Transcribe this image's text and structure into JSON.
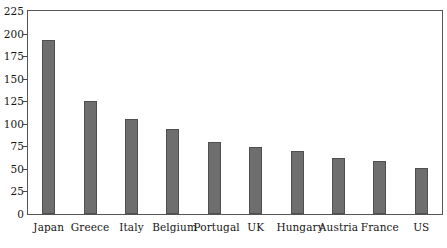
{
  "chart_data": {
    "type": "bar",
    "title": "",
    "subtitle": "",
    "xlabel": "",
    "ylabel": "",
    "categories": [
      "Japan",
      "Greece",
      "Italy",
      "Belgium",
      "Portugal",
      "UK",
      "Hungary",
      "Austria",
      "France",
      "US"
    ],
    "values": [
      193,
      125,
      105,
      94,
      80,
      74,
      70,
      62,
      59,
      51
    ],
    "series": [
      {
        "name": "",
        "values": [
          193,
          125,
          105,
          94,
          80,
          74,
          70,
          62,
          59,
          51
        ]
      }
    ],
    "ylim": [
      0,
      225
    ],
    "xlim": [
      0,
      10
    ],
    "y_ticks": [
      0,
      25,
      50,
      75,
      100,
      125,
      150,
      175,
      200,
      225
    ],
    "y_tick_labels": [
      "0",
      "25",
      "50",
      "75",
      "100",
      "125",
      "150",
      "175",
      "200",
      "225"
    ],
    "grid": false,
    "legend": false,
    "legend_position": "none",
    "bar_color": "#6e6e6e",
    "bar_border_color": "#4f4f4f",
    "axis_color": "#555555",
    "background_color": "#ffffff",
    "text_color": "#161616"
  }
}
